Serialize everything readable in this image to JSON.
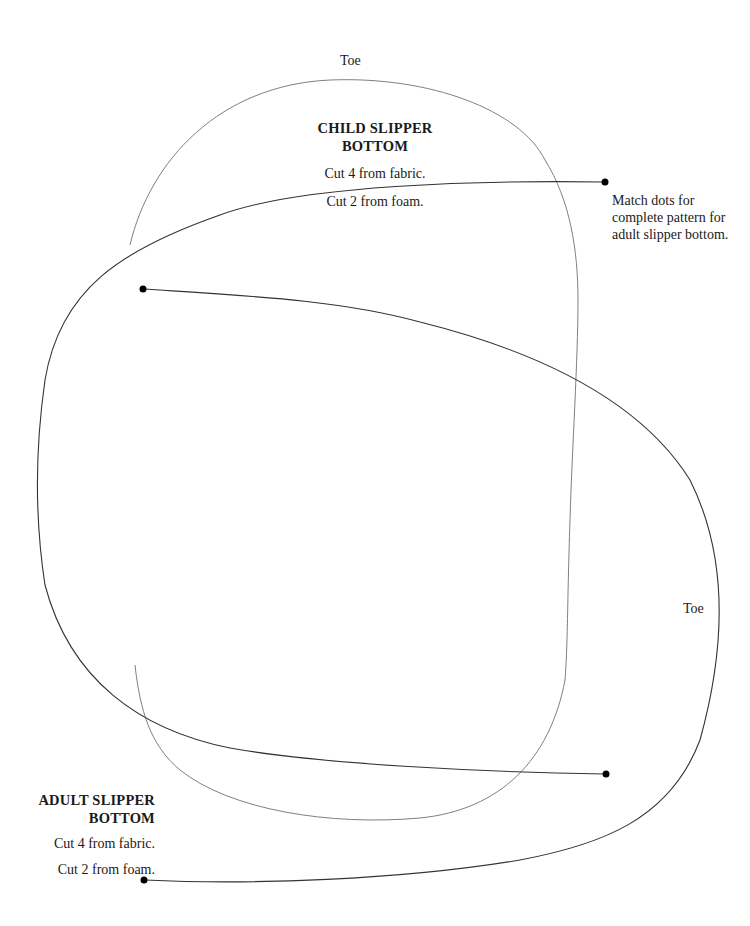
{
  "child": {
    "toe_label": "Toe",
    "title_line1": "CHILD SLIPPER",
    "title_line2": "BOTTOM",
    "instruction1": "Cut 4 from fabric.",
    "instruction2": "Cut 2 from foam."
  },
  "adult": {
    "toe_label": "Toe",
    "title_line1": "ADULT SLIPPER",
    "title_line2": "BOTTOM",
    "instruction1": "Cut 4 from fabric.",
    "instruction2": "Cut 2 from foam."
  },
  "note": {
    "text": "Match dots for complete pattern for adult slipper bottom."
  },
  "colors": {
    "child_outline": "#808080",
    "adult_outline": "#333333",
    "dot": "#000000"
  }
}
